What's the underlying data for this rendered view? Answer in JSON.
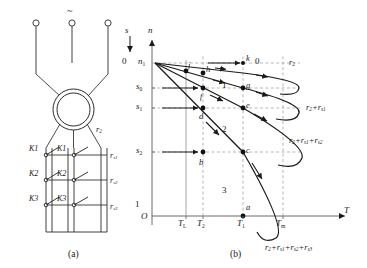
{
  "figure": {
    "panel_a_caption": "(a)",
    "panel_b_caption": "(b)",
    "circuit": {
      "supply_symbol": "~",
      "rotor_resistance_label": "r2",
      "switches": [
        "K1",
        "K1",
        "K2",
        "K2",
        "K3",
        "K3"
      ],
      "stage_resistors": [
        "rs1",
        "rs2",
        "rs3"
      ]
    },
    "axes": {
      "slip_axis_label": "s",
      "speed_axis_label": "n",
      "torque_axis_label": "T",
      "origin_label": "O",
      "slip_top": "0",
      "slip_bottom": "1",
      "sync_speed_label": "n1",
      "slip_ticks": [
        "s0",
        "s1",
        "s2"
      ],
      "torque_ticks": [
        "TL",
        "T2",
        "T1",
        "Tm"
      ]
    },
    "curves": [
      {
        "id": "c0",
        "label": "r2",
        "number": "0"
      },
      {
        "id": "c1",
        "label": "r2+rs1",
        "number": "1"
      },
      {
        "id": "c2",
        "label": "r2+rs1+rs2",
        "number": "2"
      },
      {
        "id": "c3",
        "label": "r2+rs1+rs2+rs3",
        "number": "3"
      }
    ],
    "points": [
      "a",
      "b",
      "c",
      "d",
      "e",
      "f",
      "g",
      "h",
      "j",
      "k"
    ]
  }
}
